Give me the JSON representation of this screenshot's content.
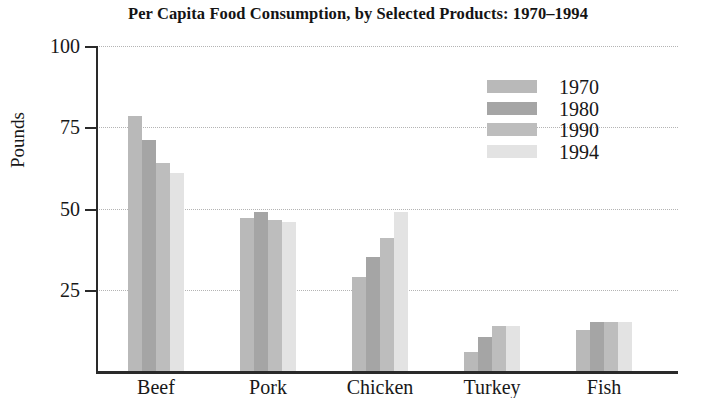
{
  "chart_data": {
    "type": "bar",
    "title": "Per Capita Food Consumption, by Selected Products: 1970–1994",
    "xlabel": "",
    "ylabel": "Pounds",
    "ylim": [
      0,
      100
    ],
    "yticks": [
      100,
      75,
      50,
      25
    ],
    "ytick_labels": [
      "100",
      "75",
      "50",
      "25"
    ],
    "grid": true,
    "legend_position": "top-right",
    "categories": [
      "Beef",
      "Pork",
      "Chicken",
      "Turkey",
      "Fish"
    ],
    "series": [
      {
        "name": "1970",
        "color": "#b9b9b9",
        "values": [
          78.5,
          47.0,
          29.0,
          6.0,
          12.5
        ]
      },
      {
        "name": "1980",
        "color": "#a5a5a5",
        "values": [
          71.0,
          49.0,
          35.0,
          10.5,
          15.0
        ]
      },
      {
        "name": "1990",
        "color": "#bdbdbd",
        "values": [
          64.0,
          46.5,
          41.0,
          14.0,
          15.0
        ]
      },
      {
        "name": "1994",
        "color": "#e3e3e3",
        "values": [
          61.0,
          46.0,
          49.0,
          14.0,
          15.0
        ]
      }
    ]
  }
}
